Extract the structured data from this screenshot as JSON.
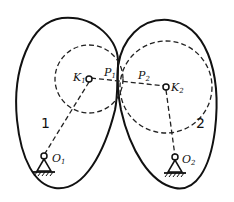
{
  "diagram": {
    "bodies": [
      {
        "id": "1",
        "label": "1",
        "center_label": "K",
        "center_sub": "1",
        "pivot_label": "O",
        "pivot_sub": "1"
      },
      {
        "id": "2",
        "label": "2",
        "center_label": "K",
        "center_sub": "2",
        "pivot_label": "O",
        "pivot_sub": "2"
      }
    ],
    "contact_points": [
      {
        "label": "P",
        "sub": "1"
      },
      {
        "label": "P",
        "sub": "2"
      }
    ]
  }
}
